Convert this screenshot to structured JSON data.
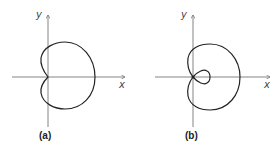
{
  "figures": [
    {
      "id": "a",
      "caption": "(a)",
      "x_label": "x",
      "y_label": "y",
      "curve": "cardioid"
    },
    {
      "id": "b",
      "caption": "(b)",
      "x_label": "x",
      "y_label": "y",
      "curve": "limacon with inner loop"
    }
  ]
}
